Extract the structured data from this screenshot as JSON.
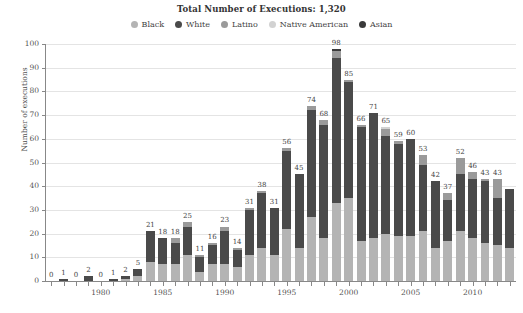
{
  "title": "Total Number of Executions: 1,320",
  "axis": {
    "ylabel": "Number of executions",
    "yticks": [
      "0",
      "10",
      "20",
      "30",
      "40",
      "50",
      "60",
      "70",
      "80",
      "90",
      "100"
    ],
    "xticks": [
      "1980",
      "1985",
      "1990",
      "1995",
      "2000",
      "2005",
      "2010"
    ]
  },
  "legend": [
    {
      "label": "Black",
      "color": "#b4b4b4"
    },
    {
      "label": "White",
      "color": "#4a4a4a"
    },
    {
      "label": "Latino",
      "color": "#9a9a9a"
    },
    {
      "label": "Native American",
      "color": "#d2d2d2"
    },
    {
      "label": "Asian",
      "color": "#3a3a3a"
    }
  ],
  "chart_data": {
    "type": "bar",
    "title": "Total Number of Executions: 1,320",
    "xlabel": "",
    "ylabel": "Number of executions",
    "ylim": [
      0,
      100
    ],
    "grid": true,
    "legend_position": "top-center",
    "stacked": true,
    "categories": [
      "1976",
      "1977",
      "1978",
      "1979",
      "1980",
      "1981",
      "1982",
      "1983",
      "1984",
      "1985",
      "1986",
      "1987",
      "1988",
      "1989",
      "1990",
      "1991",
      "1992",
      "1993",
      "1994",
      "1995",
      "1996",
      "1997",
      "1998",
      "1999",
      "2000",
      "2001",
      "2002",
      "2003",
      "2004",
      "2005",
      "2006",
      "2007",
      "2008",
      "2009",
      "2010",
      "2011",
      "2012",
      "2013"
    ],
    "totals": [
      0,
      1,
      0,
      2,
      0,
      1,
      2,
      5,
      21,
      18,
      18,
      25,
      11,
      16,
      23,
      14,
      31,
      38,
      31,
      56,
      45,
      74,
      68,
      98,
      85,
      66,
      71,
      65,
      59,
      60,
      53,
      42,
      37,
      52,
      46,
      43,
      43,
      39
    ],
    "series": [
      {
        "name": "Black",
        "color": "#b4b4b4",
        "values": [
          0,
          0,
          0,
          0,
          0,
          0,
          1,
          2,
          8,
          7,
          7,
          11,
          4,
          7,
          7,
          6,
          11,
          14,
          11,
          22,
          14,
          27,
          18,
          33,
          35,
          17,
          18,
          20,
          19,
          19,
          21,
          14,
          17,
          21,
          18,
          16,
          15,
          14
        ]
      },
      {
        "name": "White",
        "color": "#4a4a4a",
        "values": [
          0,
          1,
          0,
          2,
          0,
          1,
          1,
          3,
          13,
          11,
          9,
          12,
          6,
          8,
          14,
          7,
          19,
          23,
          20,
          33,
          31,
          45,
          48,
          61,
          49,
          48,
          53,
          41,
          39,
          41,
          28,
          28,
          17,
          24,
          25,
          26,
          20,
          25
        ]
      },
      {
        "name": "Latino",
        "color": "#9a9a9a",
        "values": [
          0,
          0,
          0,
          0,
          0,
          0,
          0,
          0,
          0,
          0,
          2,
          2,
          1,
          1,
          2,
          1,
          1,
          1,
          0,
          1,
          0,
          2,
          2,
          3,
          1,
          1,
          0,
          3,
          1,
          0,
          4,
          0,
          3,
          7,
          3,
          1,
          8,
          0
        ]
      },
      {
        "name": "Native American",
        "color": "#d2d2d2",
        "values": [
          0,
          0,
          0,
          0,
          0,
          0,
          0,
          0,
          0,
          0,
          0,
          0,
          0,
          0,
          0,
          0,
          0,
          0,
          0,
          0,
          0,
          0,
          0,
          0,
          0,
          0,
          0,
          1,
          0,
          0,
          0,
          0,
          0,
          0,
          0,
          0,
          0,
          0
        ]
      },
      {
        "name": "Asian",
        "color": "#3a3a3a",
        "values": [
          0,
          0,
          0,
          0,
          0,
          0,
          0,
          0,
          0,
          0,
          0,
          0,
          0,
          0,
          0,
          0,
          0,
          0,
          0,
          0,
          0,
          0,
          0,
          1,
          0,
          0,
          0,
          0,
          0,
          0,
          0,
          0,
          0,
          0,
          0,
          0,
          0,
          0
        ]
      }
    ],
    "bar_labels": [
      "0",
      "1",
      "0",
      "2",
      "0",
      "1",
      "2",
      "5",
      "21",
      "18",
      "18",
      "25",
      "11",
      "16",
      "23",
      "14",
      "31",
      "38",
      "31",
      "56",
      "45",
      "74",
      "68",
      "98",
      "85",
      "66",
      "71",
      "65",
      "59",
      "60",
      "53",
      "42",
      "37",
      "52",
      "46",
      "43",
      "43",
      ""
    ]
  }
}
